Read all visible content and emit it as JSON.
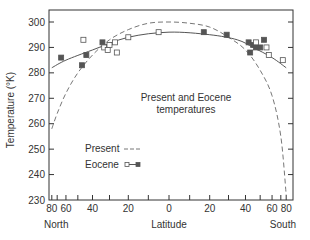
{
  "chart_data": {
    "type": "scatter",
    "title": "",
    "annotation": [
      "Present and Eocene",
      "temperatures"
    ],
    "xlabel": "Latitude",
    "xlabel_left": "North",
    "xlabel_right": "South",
    "ylabel": "Temperature (°K)",
    "ylim": [
      230,
      300
    ],
    "xlim": [
      -80,
      80
    ],
    "x_scale": "sine of latitude (equal-area), North negative, South positive",
    "x_tick_labels": [
      "80",
      "60",
      "40",
      "20",
      "0",
      "20",
      "40",
      "60",
      "80"
    ],
    "x_tick_values": [
      -80,
      -60,
      -40,
      -20,
      0,
      20,
      40,
      60,
      80
    ],
    "y_tick_labels": [
      "230",
      "240",
      "250",
      "260",
      "270",
      "280",
      "290",
      "300"
    ],
    "y_tick_values": [
      230,
      240,
      250,
      260,
      270,
      280,
      290,
      300
    ],
    "grid": false,
    "legend": [
      {
        "label": "Present",
        "style": "dashed line"
      },
      {
        "label": "Eocene",
        "style": "solid line with open and filled square markers"
      }
    ],
    "legend_position": "lower-left inside plot",
    "series": [
      {
        "name": "Present",
        "type": "line",
        "style": "dashed",
        "points": [
          {
            "lat": -80,
            "T": 258
          },
          {
            "lat": -70,
            "T": 264
          },
          {
            "lat": -60,
            "T": 272
          },
          {
            "lat": -50,
            "T": 280
          },
          {
            "lat": -40,
            "T": 287
          },
          {
            "lat": -30,
            "T": 293
          },
          {
            "lat": -20,
            "T": 297
          },
          {
            "lat": -10,
            "T": 299.5
          },
          {
            "lat": 0,
            "T": 300
          },
          {
            "lat": 10,
            "T": 299.5
          },
          {
            "lat": 20,
            "T": 298
          },
          {
            "lat": 30,
            "T": 294
          },
          {
            "lat": 40,
            "T": 289
          },
          {
            "lat": 50,
            "T": 281
          },
          {
            "lat": 60,
            "T": 271
          },
          {
            "lat": 70,
            "T": 255
          },
          {
            "lat": 80,
            "T": 232
          }
        ]
      },
      {
        "name": "Eocene (fit)",
        "type": "line",
        "style": "solid",
        "points": [
          {
            "lat": -80,
            "T": 282
          },
          {
            "lat": -60,
            "T": 285
          },
          {
            "lat": -40,
            "T": 289
          },
          {
            "lat": -20,
            "T": 294
          },
          {
            "lat": 0,
            "T": 296
          },
          {
            "lat": 20,
            "T": 295
          },
          {
            "lat": 35,
            "T": 293
          },
          {
            "lat": 45,
            "T": 290
          },
          {
            "lat": 60,
            "T": 286
          },
          {
            "lat": 80,
            "T": 282
          }
        ]
      },
      {
        "name": "Eocene (filled squares)",
        "type": "scatter",
        "marker": "filled-square",
        "points": [
          {
            "lat": -65,
            "T": 286
          },
          {
            "lat": -47,
            "T": 283
          },
          {
            "lat": -44,
            "T": 287
          },
          {
            "lat": -34,
            "T": 292
          },
          {
            "lat": 17,
            "T": 296
          },
          {
            "lat": 29,
            "T": 295
          },
          {
            "lat": 42,
            "T": 292
          },
          {
            "lat": 43,
            "T": 288
          },
          {
            "lat": 45,
            "T": 291
          },
          {
            "lat": 47,
            "T": 290
          },
          {
            "lat": 50,
            "T": 290
          },
          {
            "lat": 53,
            "T": 293
          }
        ]
      },
      {
        "name": "Eocene (open squares)",
        "type": "scatter",
        "marker": "open-square",
        "points": [
          {
            "lat": -46,
            "T": 293
          },
          {
            "lat": -33,
            "T": 290
          },
          {
            "lat": -31,
            "T": 289
          },
          {
            "lat": -30,
            "T": 291
          },
          {
            "lat": -27,
            "T": 292
          },
          {
            "lat": -26,
            "T": 288
          },
          {
            "lat": -20,
            "T": 294
          },
          {
            "lat": -5,
            "T": 296
          },
          {
            "lat": 47,
            "T": 292
          },
          {
            "lat": 55,
            "T": 290
          },
          {
            "lat": 57,
            "T": 287
          },
          {
            "lat": 73,
            "T": 285
          }
        ]
      }
    ]
  },
  "colors": {
    "axis": "#333333",
    "line": "#555555",
    "present_line": "#777777",
    "filled_marker": "#555555",
    "background": "#ffffff"
  }
}
